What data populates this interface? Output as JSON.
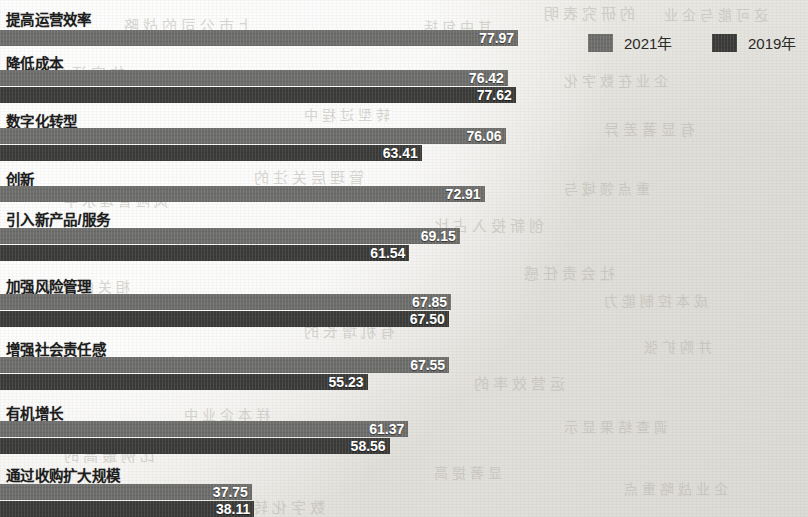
{
  "legend": {
    "position": "top-right",
    "items": [
      {
        "label": "2021年",
        "color": "#6d6d6b",
        "key": "v2021"
      },
      {
        "label": "2019年",
        "color": "#3b3b39",
        "key": "v2019"
      }
    ]
  },
  "bleed_through": [
    {
      "text": "的研究表明",
      "x": 540,
      "y": 2,
      "size": 15
    },
    {
      "text": "这可能与企业",
      "x": 660,
      "y": 4,
      "size": 14
    },
    {
      "text": "上市公司的战略",
      "x": 120,
      "y": 14,
      "size": 15
    },
    {
      "text": "其中包括",
      "x": 420,
      "y": 16,
      "size": 14
    },
    {
      "text": "的实证分析",
      "x": 30,
      "y": 62,
      "size": 15
    },
    {
      "text": "企业在数字化",
      "x": 560,
      "y": 70,
      "size": 14
    },
    {
      "text": "转型过程中",
      "x": 300,
      "y": 104,
      "size": 14
    },
    {
      "text": "有显著差异",
      "x": 600,
      "y": 118,
      "size": 15
    },
    {
      "text": "管理层关注的",
      "x": 250,
      "y": 166,
      "size": 15
    },
    {
      "text": "重点领域与",
      "x": 560,
      "y": 178,
      "size": 14
    },
    {
      "text": "风险管理水平",
      "x": 60,
      "y": 190,
      "size": 14
    },
    {
      "text": "创新投入占比",
      "x": 430,
      "y": 214,
      "size": 15
    },
    {
      "text": "的提升有关",
      "x": 170,
      "y": 240,
      "size": 14
    },
    {
      "text": "社会责任感",
      "x": 520,
      "y": 262,
      "size": 15
    },
    {
      "text": "相关的数据",
      "x": 40,
      "y": 276,
      "size": 14
    },
    {
      "text": "成本控制能力",
      "x": 600,
      "y": 290,
      "size": 14
    },
    {
      "text": "有机增长的",
      "x": 300,
      "y": 320,
      "size": 15
    },
    {
      "text": "并购扩张",
      "x": 640,
      "y": 336,
      "size": 14
    },
    {
      "text": "新产品与服务",
      "x": 90,
      "y": 352,
      "size": 14
    },
    {
      "text": "运营效率的",
      "x": 470,
      "y": 372,
      "size": 15
    },
    {
      "text": "样本企业中",
      "x": 180,
      "y": 404,
      "size": 14
    },
    {
      "text": "调查结果显示",
      "x": 560,
      "y": 416,
      "size": 14
    },
    {
      "text": "比例最高的",
      "x": 60,
      "y": 444,
      "size": 15
    },
    {
      "text": "显著提高",
      "x": 430,
      "y": 462,
      "size": 14
    },
    {
      "text": "企业战略重点",
      "x": 620,
      "y": 478,
      "size": 14
    },
    {
      "text": "数字化转型",
      "x": 230,
      "y": 496,
      "size": 15
    }
  ],
  "chart_data": {
    "type": "bar",
    "orientation": "horizontal",
    "title": "",
    "xlabel": "",
    "ylabel": "",
    "grid": false,
    "legend_position": "top-right",
    "xlim": [
      0,
      80
    ],
    "note_first_group_cropped": "2019年 bar of 提高运营效率 is cut off above the top edge",
    "categories": [
      "提高运营效率",
      "降低成本",
      "数字化转型",
      "创新",
      "引入新产品/服务",
      "加强风险管理",
      "增强社会责任感",
      "有机增长",
      "通过收购扩大规模"
    ],
    "series": [
      {
        "name": "2021年",
        "color": "#6d6d6b",
        "values": [
          77.97,
          76.42,
          76.06,
          72.91,
          69.15,
          67.85,
          67.55,
          61.37,
          37.75
        ]
      },
      {
        "name": "2019年",
        "color": "#3b3b39",
        "values": [
          null,
          77.62,
          63.41,
          null,
          61.54,
          67.5,
          55.23,
          58.56,
          38.11
        ]
      }
    ],
    "groups": [
      {
        "category": "提高运营效率",
        "label_y": 8,
        "bars": [
          {
            "series": "2021年",
            "value": 77.97,
            "value_text": "77.97",
            "y": 30
          }
        ]
      },
      {
        "category": "降低成本",
        "label_y": 52,
        "bars": [
          {
            "series": "2021年",
            "value": 76.42,
            "value_text": "76.42",
            "y": 70
          },
          {
            "series": "2019年",
            "value": 77.62,
            "value_text": "77.62",
            "y": 87
          }
        ]
      },
      {
        "category": "数字化转型",
        "label_y": 110,
        "bars": [
          {
            "series": "2021年",
            "value": 76.06,
            "value_text": "76.06",
            "y": 128
          },
          {
            "series": "2019年",
            "value": 63.41,
            "value_text": "63.41",
            "y": 145
          }
        ]
      },
      {
        "category": "创新",
        "label_y": 168,
        "bars": [
          {
            "series": "2021年",
            "value": 72.91,
            "value_text": "72.91",
            "y": 186
          }
        ]
      },
      {
        "category": "引入新产品/服务",
        "label_y": 208,
        "bars": [
          {
            "series": "2021年",
            "value": 69.15,
            "value_text": "69.15",
            "y": 228
          },
          {
            "series": "2019年",
            "value": 61.54,
            "value_text": "61.54",
            "y": 245
          }
        ]
      },
      {
        "category": "加强风险管理",
        "label_y": 275,
        "bars": [
          {
            "series": "2021年",
            "value": 67.85,
            "value_text": "67.85",
            "y": 294
          },
          {
            "series": "2019年",
            "value": 67.5,
            "value_text": "67.50",
            "y": 311
          }
        ]
      },
      {
        "category": "增强社会责任感",
        "label_y": 338,
        "bars": [
          {
            "series": "2021年",
            "value": 67.55,
            "value_text": "67.55",
            "y": 357
          },
          {
            "series": "2019年",
            "value": 55.23,
            "value_text": "55.23",
            "y": 374
          }
        ]
      },
      {
        "category": "有机增长",
        "label_y": 402,
        "bars": [
          {
            "series": "2021年",
            "value": 61.37,
            "value_text": "61.37",
            "y": 421
          },
          {
            "series": "2019年",
            "value": 58.56,
            "value_text": "58.56",
            "y": 438
          }
        ]
      },
      {
        "category": "通过收购扩大规模",
        "label_y": 464,
        "bars": [
          {
            "series": "2021年",
            "value": 37.75,
            "value_text": "37.75",
            "y": 484
          },
          {
            "series": "2019年",
            "value": 38.11,
            "value_text": "38.11",
            "y": 501
          }
        ]
      }
    ]
  }
}
